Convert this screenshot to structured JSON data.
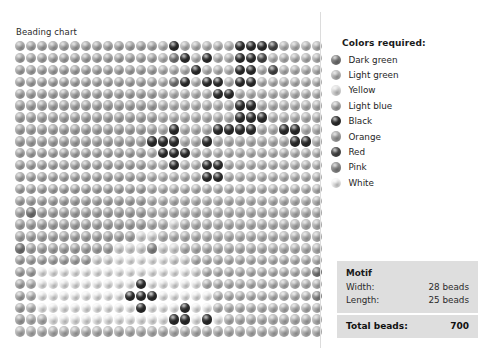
{
  "chart_title": "Beading chart",
  "legend": {
    "title": "Colors required:",
    "items": [
      {
        "label": "Dark green",
        "color": "#7d7d7d"
      },
      {
        "label": "Light green",
        "color": "#bdbdbd"
      },
      {
        "label": "Yellow",
        "color": "#e2e2e2"
      },
      {
        "label": "Light blue",
        "color": "#b0b0b0"
      },
      {
        "label": "Black",
        "color": "#2e2e2e"
      },
      {
        "label": "Orange",
        "color": "#a8a8a8"
      },
      {
        "label": "Red",
        "color": "#4a4a4a"
      },
      {
        "label": "Pink",
        "color": "#8f8f8f"
      },
      {
        "label": "White",
        "color": "#f4f4f4"
      }
    ]
  },
  "info": {
    "heading": "Motif",
    "width_label": "Width:",
    "width_value": "28 beads",
    "length_label": "Length:",
    "length_value": "25 beads",
    "total_label": "Total beads:",
    "total_value": "700"
  },
  "chart_data": {
    "type": "heatmap",
    "title": "Beading chart",
    "xlabel": "",
    "ylabel": "",
    "cols": 28,
    "rows": 25,
    "palette": {
      "dark-green": "#7d7d7d",
      "light-green": "#bdbdbd",
      "yellow": "#e2e2e2",
      "light-blue": "#b0b0b0",
      "black": "#2e2e2e",
      "orange": "#a8a8a8",
      "red": "#4a4a4a",
      "pink": "#8f8f8f",
      "white": "#f4f4f4"
    },
    "legend_order": [
      "dark-green",
      "light-green",
      "yellow",
      "light-blue",
      "black",
      "orange",
      "red",
      "pink",
      "white"
    ],
    "grid": [
      [
        "light-blue",
        "light-blue",
        "light-blue",
        "light-blue",
        "light-blue",
        "light-blue",
        "light-blue",
        "light-blue",
        "light-blue",
        "light-blue",
        "light-blue",
        "light-blue",
        "light-blue",
        "light-green",
        "black",
        "light-green",
        "light-green",
        "light-green",
        "light-green",
        "light-green",
        "black",
        "black",
        "black",
        "red",
        "light-green",
        "light-green",
        "light-green",
        "light-green"
      ],
      [
        "light-blue",
        "light-blue",
        "light-blue",
        "light-blue",
        "light-blue",
        "light-blue",
        "light-blue",
        "light-blue",
        "light-blue",
        "light-blue",
        "light-blue",
        "light-blue",
        "light-blue",
        "light-green",
        "dark-green",
        "black",
        "light-green",
        "black",
        "light-green",
        "light-green",
        "black",
        "black",
        "red",
        "light-green",
        "light-green",
        "light-green",
        "light-green",
        "light-green"
      ],
      [
        "light-blue",
        "light-blue",
        "light-blue",
        "light-blue",
        "light-blue",
        "light-blue",
        "light-blue",
        "light-blue",
        "light-blue",
        "light-blue",
        "light-blue",
        "light-blue",
        "light-blue",
        "light-green",
        "light-green",
        "light-green",
        "black",
        "light-green",
        "light-green",
        "light-green",
        "black",
        "black",
        "light-green",
        "red",
        "light-green",
        "light-green",
        "light-green",
        "light-green"
      ],
      [
        "light-blue",
        "light-blue",
        "light-blue",
        "light-blue",
        "light-blue",
        "light-blue",
        "light-blue",
        "light-blue",
        "light-blue",
        "light-blue",
        "light-blue",
        "light-blue",
        "light-blue",
        "light-green",
        "dark-green",
        "black",
        "light-green",
        "black",
        "black",
        "light-green",
        "black",
        "black",
        "light-green",
        "light-green",
        "light-green",
        "light-green",
        "light-green",
        "light-green"
      ],
      [
        "light-blue",
        "light-blue",
        "light-blue",
        "light-blue",
        "light-blue",
        "light-blue",
        "light-blue",
        "light-blue",
        "light-blue",
        "light-blue",
        "light-blue",
        "light-blue",
        "light-blue",
        "light-green",
        "light-green",
        "light-green",
        "light-green",
        "light-green",
        "black",
        "black",
        "light-green",
        "light-green",
        "light-green",
        "light-green",
        "light-green",
        "light-green",
        "light-green",
        "light-green"
      ],
      [
        "light-blue",
        "light-blue",
        "light-blue",
        "light-blue",
        "light-blue",
        "light-blue",
        "light-blue",
        "light-blue",
        "light-blue",
        "light-blue",
        "light-blue",
        "light-blue",
        "light-blue",
        "light-green",
        "light-green",
        "light-green",
        "light-green",
        "light-green",
        "light-green",
        "light-green",
        "black",
        "black",
        "light-green",
        "light-green",
        "light-green",
        "light-green",
        "light-green",
        "light-green"
      ],
      [
        "light-blue",
        "light-blue",
        "light-blue",
        "light-blue",
        "light-blue",
        "light-blue",
        "light-blue",
        "light-blue",
        "light-blue",
        "light-blue",
        "light-blue",
        "light-blue",
        "light-blue",
        "light-green",
        "light-green",
        "light-green",
        "light-green",
        "light-green",
        "light-green",
        "light-green",
        "black",
        "black",
        "black",
        "light-green",
        "light-green",
        "light-green",
        "light-green",
        "light-green"
      ],
      [
        "light-blue",
        "light-blue",
        "light-blue",
        "light-blue",
        "light-blue",
        "light-blue",
        "light-blue",
        "light-blue",
        "light-blue",
        "light-blue",
        "light-blue",
        "light-blue",
        "light-blue",
        "light-green",
        "black",
        "light-green",
        "light-green",
        "light-green",
        "black",
        "black",
        "black",
        "black",
        "light-green",
        "light-green",
        "black",
        "black",
        "light-green",
        "light-green"
      ],
      [
        "light-blue",
        "light-blue",
        "light-blue",
        "light-blue",
        "light-blue",
        "light-blue",
        "light-blue",
        "light-blue",
        "light-blue",
        "light-blue",
        "light-blue",
        "light-blue",
        "black",
        "black",
        "black",
        "light-green",
        "light-green",
        "black",
        "light-green",
        "light-green",
        "light-green",
        "light-green",
        "light-green",
        "light-green",
        "light-green",
        "black",
        "black",
        "light-green"
      ],
      [
        "light-blue",
        "light-blue",
        "light-blue",
        "light-blue",
        "light-blue",
        "light-blue",
        "light-blue",
        "light-blue",
        "light-blue",
        "light-blue",
        "light-blue",
        "light-blue",
        "light-green",
        "black",
        "black",
        "black",
        "light-green",
        "light-green",
        "light-green",
        "light-green",
        "light-green",
        "light-green",
        "light-green",
        "light-green",
        "light-green",
        "light-green",
        "light-green",
        "light-green"
      ],
      [
        "light-blue",
        "light-blue",
        "light-blue",
        "light-blue",
        "light-blue",
        "light-blue",
        "light-blue",
        "light-blue",
        "light-blue",
        "light-blue",
        "light-blue",
        "light-blue",
        "light-green",
        "light-green",
        "black",
        "light-green",
        "light-green",
        "black",
        "black",
        "light-green",
        "light-green",
        "light-green",
        "light-green",
        "light-green",
        "light-green",
        "light-green",
        "light-green",
        "light-green"
      ],
      [
        "light-blue",
        "light-blue",
        "light-blue",
        "light-blue",
        "light-blue",
        "light-blue",
        "light-blue",
        "light-blue",
        "light-blue",
        "light-blue",
        "light-blue",
        "light-blue",
        "light-green",
        "light-green",
        "light-green",
        "light-green",
        "light-green",
        "black",
        "black",
        "light-green",
        "light-green",
        "light-green",
        "light-green",
        "light-green",
        "light-green",
        "light-green",
        "light-green",
        "light-green"
      ],
      [
        "light-blue",
        "light-blue",
        "light-blue",
        "light-blue",
        "light-blue",
        "light-blue",
        "light-blue",
        "light-blue",
        "light-blue",
        "light-blue",
        "light-blue",
        "light-blue",
        "light-green",
        "light-green",
        "light-green",
        "light-green",
        "light-green",
        "light-green",
        "light-green",
        "light-green",
        "light-green",
        "light-green",
        "light-green",
        "light-green",
        "light-green",
        "light-green",
        "light-green",
        "light-green"
      ],
      [
        "light-blue",
        "light-blue",
        "light-blue",
        "light-blue",
        "light-blue",
        "light-blue",
        "light-blue",
        "light-blue",
        "light-blue",
        "light-blue",
        "light-blue",
        "light-blue",
        "light-green",
        "light-green",
        "light-green",
        "light-green",
        "light-green",
        "light-green",
        "light-green",
        "light-green",
        "light-green",
        "light-green",
        "light-green",
        "light-green",
        "light-green",
        "light-green",
        "light-green",
        "light-green"
      ],
      [
        "light-blue",
        "dark-green",
        "light-blue",
        "light-blue",
        "light-blue",
        "light-blue",
        "light-blue",
        "light-blue",
        "light-blue",
        "light-blue",
        "light-blue",
        "light-blue",
        "light-green",
        "light-green",
        "light-green",
        "light-green",
        "light-green",
        "light-green",
        "light-green",
        "light-green",
        "light-green",
        "light-green",
        "light-green",
        "light-green",
        "light-green",
        "light-green",
        "light-green",
        "light-green"
      ],
      [
        "light-blue",
        "light-blue",
        "light-blue",
        "light-blue",
        "light-blue",
        "light-blue",
        "light-blue",
        "light-blue",
        "light-blue",
        "light-blue",
        "light-blue",
        "light-blue",
        "light-green",
        "light-green",
        "yellow",
        "light-green",
        "light-green",
        "light-green",
        "light-green",
        "light-green",
        "light-green",
        "light-green",
        "light-green",
        "light-green",
        "light-green",
        "light-green",
        "light-green",
        "light-green"
      ],
      [
        "light-blue",
        "light-blue",
        "light-blue",
        "light-blue",
        "light-blue",
        "light-blue",
        "light-blue",
        "light-blue",
        "light-blue",
        "light-blue",
        "light-blue",
        "yellow",
        "yellow",
        "light-green",
        "light-green",
        "light-green",
        "light-green",
        "light-green",
        "light-green",
        "light-green",
        "light-green",
        "light-green",
        "light-green",
        "light-green",
        "light-green",
        "light-green",
        "light-green",
        "light-green"
      ],
      [
        "dark-green",
        "light-blue",
        "light-blue",
        "light-blue",
        "light-blue",
        "light-blue",
        "light-blue",
        "light-blue",
        "light-blue",
        "yellow",
        "yellow",
        "yellow",
        "pink",
        "yellow",
        "yellow",
        "light-green",
        "light-green",
        "light-green",
        "light-green",
        "light-green",
        "light-green",
        "light-green",
        "light-green",
        "light-green",
        "light-green",
        "light-green",
        "light-green",
        "light-green"
      ],
      [
        "light-blue",
        "light-blue",
        "light-blue",
        "light-blue",
        "light-blue",
        "light-blue",
        "light-blue",
        "yellow",
        "yellow",
        "white",
        "white",
        "white",
        "white",
        "white",
        "yellow",
        "yellow",
        "light-green",
        "light-green",
        "light-green",
        "light-green",
        "light-green",
        "light-green",
        "light-green",
        "light-green",
        "light-green",
        "light-green",
        "light-green",
        "light-green"
      ],
      [
        "light-blue",
        "light-blue",
        "white",
        "white",
        "white",
        "white",
        "white",
        "white",
        "white",
        "white",
        "white",
        "white",
        "white",
        "white",
        "white",
        "white",
        "yellow",
        "light-green",
        "light-green",
        "light-green",
        "light-green",
        "light-green",
        "light-green",
        "light-green",
        "light-green",
        "light-green",
        "light-green",
        "dark-green"
      ],
      [
        "light-blue",
        "light-green",
        "white",
        "white",
        "white",
        "white",
        "white",
        "white",
        "white",
        "white",
        "white",
        "black",
        "white",
        "white",
        "white",
        "white",
        "white",
        "light-green",
        "light-green",
        "light-green",
        "light-green",
        "light-green",
        "light-green",
        "light-green",
        "light-green",
        "light-green",
        "light-green",
        "light-green"
      ],
      [
        "light-blue",
        "light-green",
        "white",
        "white",
        "white",
        "white",
        "white",
        "white",
        "white",
        "white",
        "black",
        "black",
        "black",
        "white",
        "white",
        "white",
        "white",
        "white",
        "light-green",
        "light-green",
        "light-green",
        "light-green",
        "light-green",
        "light-green",
        "light-green",
        "light-green",
        "light-green",
        "pink"
      ],
      [
        "light-blue",
        "light-green",
        "white",
        "white",
        "white",
        "white",
        "white",
        "white",
        "white",
        "white",
        "white",
        "black",
        "white",
        "white",
        "white",
        "black",
        "white",
        "white",
        "light-green",
        "light-green",
        "light-green",
        "light-green",
        "light-green",
        "light-green",
        "light-green",
        "light-green",
        "light-green",
        "light-green"
      ],
      [
        "light-blue",
        "light-green",
        "light-green",
        "white",
        "white",
        "white",
        "white",
        "white",
        "white",
        "white",
        "white",
        "white",
        "white",
        "white",
        "black",
        "black",
        "white",
        "black",
        "white",
        "light-green",
        "light-green",
        "light-green",
        "light-green",
        "light-green",
        "light-green",
        "light-green",
        "light-green",
        "light-green"
      ],
      [
        "light-green",
        "light-green",
        "light-green",
        "light-green",
        "light-green",
        "light-green",
        "light-green",
        "light-green",
        "light-green",
        "light-green",
        "light-green",
        "light-green",
        "light-green",
        "light-green",
        "light-green",
        "light-green",
        "light-green",
        "light-green",
        "light-green",
        "light-green",
        "light-green",
        "light-green",
        "light-green",
        "light-green",
        "light-green",
        "light-green",
        "light-green",
        "light-green"
      ]
    ]
  }
}
